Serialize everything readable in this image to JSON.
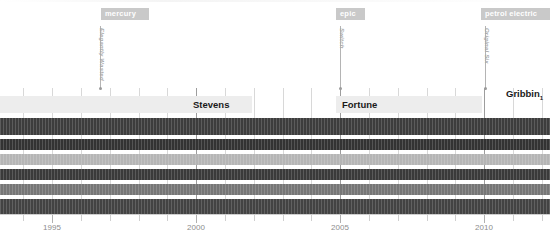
{
  "chart_data": {
    "type": "bar",
    "title": "",
    "subtitle": "",
    "xlabel": "",
    "ylabel": "",
    "orientation": "horizontal",
    "xlim": [
      1993.0,
      2012.4
    ],
    "grid": true,
    "legend_position": "none",
    "axis": {
      "tick_labels": [
        "1995",
        "2000",
        "2005",
        "2010"
      ],
      "tick_values": [
        1995,
        2000,
        2005,
        2010
      ],
      "minor_tick_values": [
        1994,
        1996,
        1997,
        1998,
        1999,
        2001,
        2002,
        2003,
        2004,
        2006,
        2007,
        2008,
        2009,
        2011,
        2012
      ]
    },
    "categories": [
      "row-1",
      "row-2",
      "row-3",
      "row-4",
      "row-5",
      "row-6"
    ],
    "values": [
      2012.4,
      2012.4,
      2012.4,
      2012.4,
      2012.4,
      2012.4
    ],
    "series": [
      {
        "name": "row-1",
        "start": 1993.0,
        "end": 2012.4,
        "color": "#3d3d3d"
      },
      {
        "name": "row-2",
        "start": 1993.0,
        "end": 2012.4,
        "color": "#333333"
      },
      {
        "name": "row-3",
        "start": 1993.0,
        "end": 2012.4,
        "color": "#b5b5b5"
      },
      {
        "name": "row-4",
        "start": 1993.0,
        "end": 2012.4,
        "color": "#3a3a3a"
      },
      {
        "name": "row-5",
        "start": 1993.0,
        "end": 2012.4,
        "color": "#767676"
      },
      {
        "name": "row-6",
        "start": 1993.0,
        "end": 2012.4,
        "color": "#434343"
      }
    ],
    "eras": [
      {
        "label": "mercury",
        "x": 1997.0
      },
      {
        "label": "epic",
        "x": 2005.0
      },
      {
        "label": "petrol electric",
        "x": 2010.1
      }
    ],
    "events": [
      {
        "label": "Elegantly Wasted",
        "x": 1997.0
      },
      {
        "label": "Switch",
        "x": 2005.0
      },
      {
        "label": "Original Six",
        "x": 2010.1
      }
    ],
    "annotations": [
      {
        "label": "Stevens",
        "x": 2000.1,
        "band": true
      },
      {
        "label": "Fortune",
        "x": 2005.1,
        "band": true
      },
      {
        "label": "Gribbin",
        "sub": "1",
        "x": 2010.6,
        "band": false
      }
    ]
  },
  "eras": [
    {
      "name": "era-mercury",
      "label": "mercury",
      "left": 101,
      "width": 48
    },
    {
      "name": "era-epic",
      "label": "epic",
      "left": 336,
      "width": 29
    },
    {
      "name": "era-petrol-electric",
      "label": "petrol electric",
      "left": 481,
      "width": 69
    }
  ],
  "events": [
    {
      "name": "event-elegantly-wasted",
      "label": "Elegantly Wasted",
      "left": 100,
      "top": 26,
      "height": 63
    },
    {
      "name": "event-switch",
      "label": "Switch",
      "left": 340,
      "top": 26,
      "height": 63
    },
    {
      "name": "event-original-six",
      "label": "Original Six",
      "left": 485,
      "top": 26,
      "height": 63
    }
  ],
  "bands": [
    {
      "name": "band-stevens",
      "label": "Stevens",
      "left": 0,
      "width": 252,
      "top": 96
    },
    {
      "name": "band-fortune",
      "label": "Fortune",
      "left": 336,
      "width": 146,
      "top": 96
    }
  ],
  "labels": [
    {
      "name": "label-stevens",
      "text": "Stevens",
      "left": 193,
      "top": 96
    },
    {
      "name": "label-fortune",
      "text": "Fortune",
      "left": 342,
      "top": 96
    },
    {
      "name": "label-gribbin",
      "text": "Gribbin",
      "sub": "1",
      "left": 506,
      "top": 85
    }
  ],
  "bars": [
    {
      "name": "bar-row-1",
      "top": 118,
      "height": 17,
      "color": "#3d3d3d",
      "width": 550
    },
    {
      "name": "bar-row-2",
      "top": 139,
      "height": 11,
      "color": "#333333",
      "width": 550
    },
    {
      "name": "bar-row-3",
      "top": 154,
      "height": 11,
      "color": "#b5b5b5",
      "width": 550
    },
    {
      "name": "bar-row-4",
      "top": 169,
      "height": 11,
      "color": "#3a3a3a",
      "width": 550
    },
    {
      "name": "bar-row-5",
      "top": 184,
      "height": 11,
      "color": "#767676",
      "width": 550
    },
    {
      "name": "bar-row-6",
      "top": 199,
      "height": 15,
      "color": "#434343",
      "width": 550
    }
  ],
  "axis": {
    "name": "time-axis",
    "line_top": 214,
    "labels": [
      {
        "text": "1995",
        "left": 52
      },
      {
        "text": "2000",
        "left": 196
      },
      {
        "text": "2005",
        "left": 340
      },
      {
        "text": "2010",
        "left": 484
      }
    ],
    "ticks_major": [
      52,
      196,
      340,
      484
    ],
    "ticks_minor": [
      23,
      81,
      110,
      139,
      167,
      225,
      254,
      283,
      311,
      369,
      398,
      427,
      455,
      513,
      542
    ]
  },
  "gridlines": {
    "name": "vertical-gridlines",
    "minor": [
      23,
      52,
      81,
      110,
      139,
      167,
      225,
      254,
      283,
      311,
      369,
      398,
      427,
      455,
      513,
      542
    ],
    "major": [
      196,
      340,
      484
    ]
  }
}
